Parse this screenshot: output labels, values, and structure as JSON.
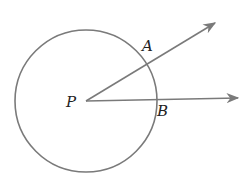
{
  "diagram": {
    "colors": {
      "stroke": "#7a7a7a",
      "label": "#222222",
      "background": "#ffffff"
    },
    "circle": {
      "cx": 86,
      "cy": 101,
      "r": 71
    },
    "center_point": {
      "label": "P",
      "x": 86,
      "y": 101
    },
    "rays": [
      {
        "name": "ray-PA",
        "from": [
          86,
          101
        ],
        "to": [
          215,
          23
        ]
      },
      {
        "name": "ray-PB",
        "from": [
          86,
          101
        ],
        "to": [
          238,
          98
        ]
      }
    ],
    "points": [
      {
        "label": "A",
        "x": 146,
        "y": 64
      },
      {
        "label": "B",
        "x": 156,
        "y": 100
      }
    ],
    "labels": {
      "P": "P",
      "A": "A",
      "B": "B"
    }
  }
}
